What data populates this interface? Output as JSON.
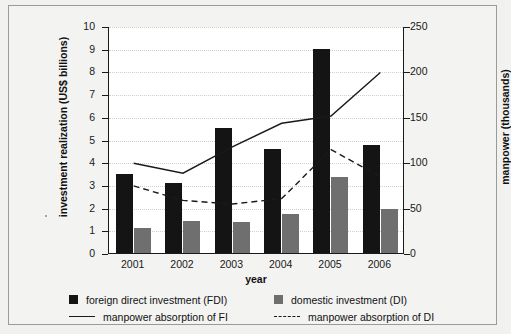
{
  "chart_data": {
    "type": "bar",
    "title": "",
    "xlabel": "year",
    "ylabel": "investment realization (US$ billions)",
    "ylabel_right": "manpower (thousands)",
    "categories": [
      "2001",
      "2002",
      "2003",
      "2004",
      "2005",
      "2006"
    ],
    "ylim": [
      0,
      10
    ],
    "yticks": [
      0,
      1,
      2,
      3,
      4,
      5,
      6,
      7,
      8,
      9,
      10
    ],
    "ylim_right": [
      0,
      250
    ],
    "yticks_right": [
      0,
      50,
      100,
      150,
      200,
      250
    ],
    "grid": true,
    "legend_position": "bottom",
    "series": [
      {
        "name": "foreign direct investment (FDI)",
        "kind": "bar",
        "axis": "left",
        "color": "#141414",
        "values": [
          3.5,
          3.1,
          5.5,
          4.6,
          9.0,
          4.75
        ]
      },
      {
        "name": "domestic investment (DI)",
        "kind": "bar",
        "axis": "left",
        "color": "#6f6f6f",
        "values": [
          1.1,
          1.4,
          1.35,
          1.7,
          3.35,
          1.95
        ]
      },
      {
        "name": "manpower absorption of FI",
        "kind": "line",
        "style": "solid",
        "axis": "right",
        "color": "#1a1a1a",
        "values": [
          100,
          89,
          118,
          144,
          152,
          200
        ]
      },
      {
        "name": "manpower absorption of DI",
        "kind": "line",
        "style": "dashed",
        "axis": "right",
        "color": "#1a1a1a",
        "values": [
          75,
          59,
          55,
          61,
          115,
          85
        ]
      }
    ]
  },
  "axes": {
    "left_label": "investment realization (US$ billions)",
    "right_label": "manpower (thousands)",
    "x_label": "year"
  },
  "legend": {
    "items": [
      {
        "label": "foreign direct investment (FDI)",
        "marker": "square-dark"
      },
      {
        "label": "domestic investment (DI)",
        "marker": "square-gray"
      },
      {
        "label": "manpower absorption of FI",
        "marker": "line-solid"
      },
      {
        "label": "manpower absorption of DI",
        "marker": "line-dashed"
      }
    ]
  }
}
